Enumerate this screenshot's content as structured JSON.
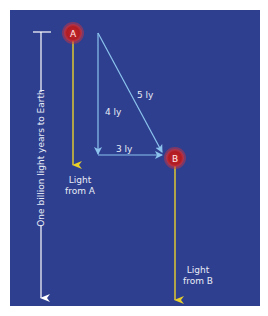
{
  "diagram": {
    "colors": {
      "page_background": "#ffffff",
      "panel": "#2e3f8f",
      "star": "#b01c22",
      "star_glow": "#d8343a",
      "light_ray": "#e8cf2a",
      "geometry_lines": "#8cc4ee",
      "scale_bar": "#ffffff",
      "text": "#e8ecf6"
    },
    "scale_bar": {
      "label": "One billion light years to Earth"
    },
    "stars": [
      {
        "id": "A",
        "label": "A"
      },
      {
        "id": "B",
        "label": "B"
      }
    ],
    "distances": {
      "vertical": "4 ly",
      "horizontal": "3 ly",
      "diagonal": "5 ly"
    },
    "light_labels": {
      "a_line1": "Light",
      "a_line2": "from A",
      "b_line1": "Light",
      "b_line2": "from B"
    }
  }
}
